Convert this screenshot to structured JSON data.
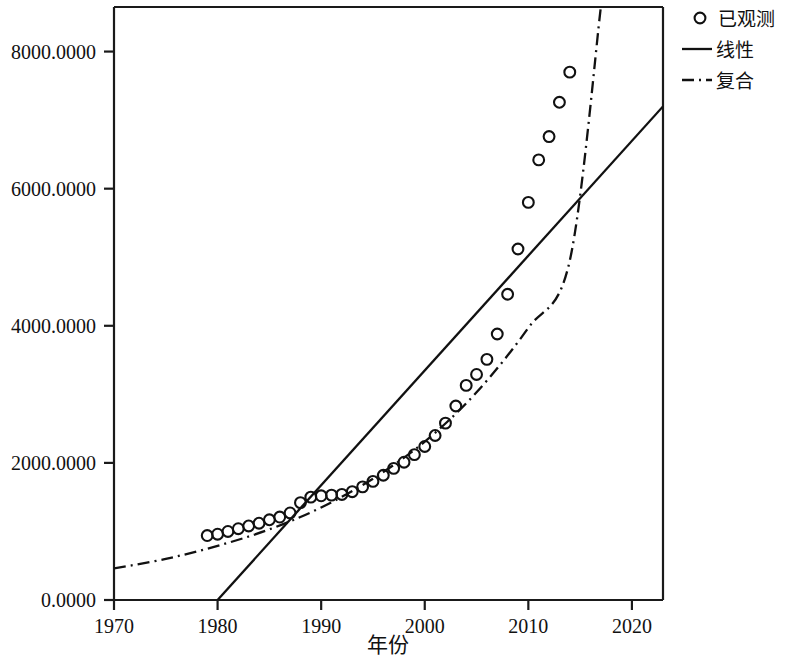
{
  "chart_data": {
    "type": "scatter",
    "title": "",
    "xlabel": "年份",
    "ylabel": "",
    "xlim": [
      1970,
      2023
    ],
    "ylim": [
      0,
      8650
    ],
    "grid": false,
    "legend_position": "top-right",
    "x_ticks": [
      1970,
      1980,
      1990,
      2000,
      2010,
      2020
    ],
    "x_tick_labels": [
      "1970",
      "1980",
      "1990",
      "2000",
      "2010",
      "2020"
    ],
    "y_ticks": [
      0,
      2000,
      4000,
      6000,
      8000
    ],
    "y_tick_labels": [
      "0.0000",
      "2000.0000",
      "4000.0000",
      "6000.0000",
      "8000.0000"
    ],
    "series": [
      {
        "name": "已观测",
        "type": "scatter",
        "marker": "open-circle",
        "x": [
          1979,
          1980,
          1981,
          1982,
          1983,
          1984,
          1985,
          1986,
          1987,
          1988,
          1989,
          1990,
          1991,
          1992,
          1993,
          1994,
          1995,
          1996,
          1997,
          1998,
          1999,
          2000,
          2001,
          2002,
          2003,
          2004,
          2005,
          2006,
          2007,
          2008,
          2009,
          2010,
          2011,
          2012,
          2013,
          2014
        ],
        "values": [
          940,
          960,
          1000,
          1040,
          1080,
          1120,
          1170,
          1210,
          1270,
          1420,
          1500,
          1520,
          1530,
          1540,
          1580,
          1650,
          1730,
          1820,
          1920,
          2010,
          2120,
          2240,
          2400,
          2580,
          2830,
          3130,
          3290,
          3510,
          3880,
          4460,
          5120,
          5800,
          6420,
          6760,
          7260,
          7700
        ]
      },
      {
        "name": "线性",
        "type": "line",
        "style": "solid",
        "x": [
          1980,
          2023
        ],
        "values": [
          0,
          7200
        ]
      },
      {
        "name": "复合",
        "type": "line",
        "style": "dash-dot",
        "x": [
          1970,
          1975,
          1980,
          1985,
          1990,
          1995,
          2000,
          2005,
          2010,
          2014,
          2017
        ],
        "values": [
          460,
          600,
          790,
          1030,
          1350,
          1770,
          2310,
          3030,
          3970,
          4950,
          8650
        ]
      }
    ],
    "legend": [
      {
        "label": "已观测",
        "marker": "open-circle"
      },
      {
        "label": "线性",
        "marker": "solid-line"
      },
      {
        "label": "复合",
        "marker": "dash-dot-line"
      }
    ],
    "colors": {
      "foreground": "#111111",
      "background": "#ffffff"
    }
  }
}
